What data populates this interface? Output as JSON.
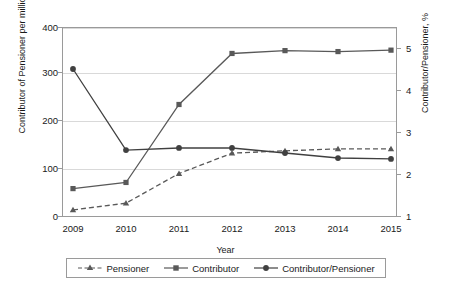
{
  "chart_data": {
    "type": "line",
    "title": "",
    "xlabel": "Year",
    "ylabel": "Contributor of Pensioner per million",
    "ylabel_secondary": "Contributor/Pensioner, %",
    "categories": [
      "2009",
      "2010",
      "2011",
      "2012",
      "2013",
      "2014",
      "2015"
    ],
    "ylim": [
      0,
      400
    ],
    "ylim_secondary": [
      1,
      5
    ],
    "yticks": [
      "0",
      "100",
      "200",
      "300",
      "400"
    ],
    "yticks_secondary": [
      "1",
      "2",
      "3",
      "4",
      "5"
    ],
    "grid": true,
    "legend_position": "bottom",
    "series": [
      {
        "name": "Pensioner",
        "axis": "left",
        "marker": "triangle",
        "linestyle": "dashed",
        "color": "#595959",
        "values": [
          13,
          27,
          90,
          133,
          138,
          142,
          142
        ]
      },
      {
        "name": "Contributor",
        "axis": "left",
        "marker": "square",
        "linestyle": "solid",
        "color": "#595959",
        "values": [
          58,
          71,
          236,
          344,
          350,
          348,
          351
        ]
      },
      {
        "name": "Contributor/Pensioner",
        "axis": "right",
        "marker": "circle",
        "linestyle": "solid",
        "color": "#404040",
        "values": [
          4.5,
          2.57,
          2.62,
          2.62,
          2.5,
          2.38,
          2.36
        ]
      }
    ]
  },
  "axes": {
    "left_title": "Contributor of Pensioner per million",
    "right_title": "Contributor/Pensioner, %",
    "x_title": "Year",
    "left_ticks": [
      "400",
      "300",
      "200",
      "100",
      "0"
    ],
    "right_ticks": [
      "5",
      "4",
      "3",
      "2",
      "1"
    ],
    "x_ticks": [
      "2009",
      "2010",
      "2011",
      "2012",
      "2013",
      "2014",
      "2015"
    ]
  },
  "legend": {
    "items": [
      {
        "label": "Pensioner",
        "marker": "triangle-marker",
        "style": "dashed"
      },
      {
        "label": "Contributor",
        "marker": "square-marker",
        "style": "solid"
      },
      {
        "label": "Contributor/Pensioner",
        "marker": "circle-marker",
        "style": "solid"
      }
    ]
  },
  "colors": {
    "line": "#595959",
    "ratio_line": "#404040",
    "grid": "#d9d9d9",
    "frame": "#9a9a9a",
    "text": "#1a1a1a"
  }
}
